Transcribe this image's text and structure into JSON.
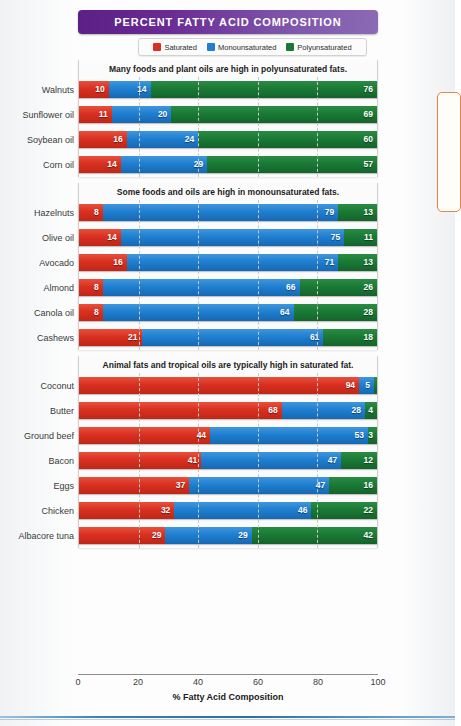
{
  "title": "PERCENT FATTY ACID COMPOSITION",
  "legend": {
    "items": [
      {
        "label": "Saturated",
        "color": "#d93021",
        "icon": "legend-swatch-saturated"
      },
      {
        "label": "Monounsaturated",
        "color": "#1f7fd0",
        "icon": "legend-swatch-monounsaturated"
      },
      {
        "label": "Polyunsaturated",
        "color": "#1a7a35",
        "icon": "legend-swatch-polyunsaturated"
      }
    ]
  },
  "axis": {
    "title": "% Fatty Acid Composition",
    "ticks": [
      "0",
      "20",
      "40",
      "60",
      "80",
      "100"
    ]
  },
  "chart_data": {
    "type": "bar",
    "orientation": "horizontal",
    "stacked": true,
    "title": "PERCENT FATTY ACID COMPOSITION",
    "xlabel": "% Fatty Acid Composition",
    "ylabel": "",
    "xlim": [
      0,
      100
    ],
    "xticks": [
      0,
      20,
      40,
      60,
      80,
      100
    ],
    "grid": "vertical-dashed",
    "legend_position": "top-center",
    "series": [
      {
        "name": "Saturated",
        "color": "#d93021"
      },
      {
        "name": "Monounsaturated",
        "color": "#1f7fd0"
      },
      {
        "name": "Polyunsaturated",
        "color": "#1a7a35"
      }
    ],
    "panels": [
      {
        "header": "Many foods and plant oils are high in polyunsaturated fats.",
        "categories": [
          "Walnuts",
          "Sunflower oil",
          "Soybean oil",
          "Corn oil"
        ],
        "rows": [
          {
            "label": "Walnuts",
            "saturated": 10,
            "monounsaturated": 14,
            "polyunsaturated": 76
          },
          {
            "label": "Sunflower oil",
            "saturated": 11,
            "monounsaturated": 20,
            "polyunsaturated": 69
          },
          {
            "label": "Soybean oil",
            "saturated": 16,
            "monounsaturated": 24,
            "polyunsaturated": 60
          },
          {
            "label": "Corn oil",
            "saturated": 14,
            "monounsaturated": 29,
            "polyunsaturated": 57
          }
        ]
      },
      {
        "header": "Some foods and oils are high in monounsaturated fats.",
        "categories": [
          "Hazelnuts",
          "Olive oil",
          "Avocado",
          "Almond",
          "Canola oil",
          "Cashews"
        ],
        "rows": [
          {
            "label": "Hazelnuts",
            "saturated": 8,
            "monounsaturated": 79,
            "polyunsaturated": 13
          },
          {
            "label": "Olive oil",
            "saturated": 14,
            "monounsaturated": 75,
            "polyunsaturated": 11
          },
          {
            "label": "Avocado",
            "saturated": 16,
            "monounsaturated": 71,
            "polyunsaturated": 13
          },
          {
            "label": "Almond",
            "saturated": 8,
            "monounsaturated": 66,
            "polyunsaturated": 26
          },
          {
            "label": "Canola oil",
            "saturated": 8,
            "monounsaturated": 64,
            "polyunsaturated": 28
          },
          {
            "label": "Cashews",
            "saturated": 21,
            "monounsaturated": 61,
            "polyunsaturated": 18
          }
        ]
      },
      {
        "header": "Animal fats and tropical oils are typically high in saturated fat.",
        "categories": [
          "Coconut",
          "Butter",
          "Ground beef",
          "Bacon",
          "Eggs",
          "Chicken",
          "Albacore tuna"
        ],
        "rows": [
          {
            "label": "Coconut",
            "saturated": 94,
            "monounsaturated": 5,
            "polyunsaturated": 1
          },
          {
            "label": "Butter",
            "saturated": 68,
            "monounsaturated": 28,
            "polyunsaturated": 4
          },
          {
            "label": "Ground beef",
            "saturated": 44,
            "monounsaturated": 53,
            "polyunsaturated": 3
          },
          {
            "label": "Bacon",
            "saturated": 41,
            "monounsaturated": 47,
            "polyunsaturated": 12
          },
          {
            "label": "Eggs",
            "saturated": 37,
            "monounsaturated": 47,
            "polyunsaturated": 16
          },
          {
            "label": "Chicken",
            "saturated": 32,
            "monounsaturated": 46,
            "polyunsaturated": 22
          },
          {
            "label": "Albacore tuna",
            "saturated": 29,
            "monounsaturated": 29,
            "polyunsaturated": 42
          }
        ]
      }
    ]
  }
}
